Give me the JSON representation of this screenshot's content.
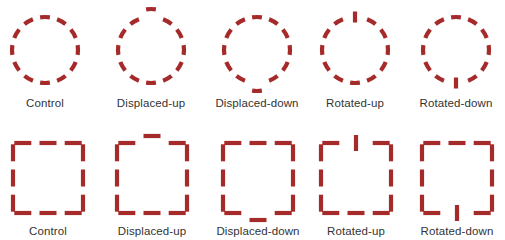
{
  "figure": {
    "stroke_color": "#a52a2a",
    "background": "#ffffff",
    "rows": [
      {
        "shape": "circle",
        "label_y": 105,
        "items": [
          {
            "label": "Control",
            "cx": 45,
            "cy": 50,
            "variant": "control"
          },
          {
            "label": "Displaced-up",
            "cx": 151,
            "cy": 50,
            "variant": "displaced-up"
          },
          {
            "label": "Displaced-down",
            "cx": 257,
            "cy": 50,
            "variant": "displaced-down"
          },
          {
            "label": "Rotated-up",
            "cx": 355,
            "cy": 50,
            "variant": "rotated-up"
          },
          {
            "label": "Rotated-down",
            "cx": 456,
            "cy": 50,
            "variant": "rotated-down"
          }
        ]
      },
      {
        "shape": "square",
        "label_y": 233,
        "items": [
          {
            "label": "Control",
            "cx": 48,
            "cy": 178,
            "variant": "control"
          },
          {
            "label": "Displaced-up",
            "cx": 152,
            "cy": 178,
            "variant": "displaced-up"
          },
          {
            "label": "Displaced-down",
            "cx": 258,
            "cy": 178,
            "variant": "displaced-down"
          },
          {
            "label": "Rotated-up",
            "cx": 356,
            "cy": 178,
            "variant": "rotated-up"
          },
          {
            "label": "Rotated-down",
            "cx": 457,
            "cy": 178,
            "variant": "rotated-down"
          }
        ]
      }
    ]
  }
}
